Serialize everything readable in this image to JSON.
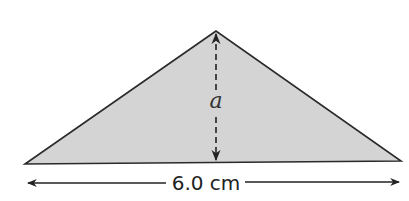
{
  "diagram": {
    "shape": "triangle",
    "fill_color": "#d4d4d4",
    "stroke_color": "#2a2a2a",
    "height_label": "a",
    "base_label": "6.0 cm"
  }
}
